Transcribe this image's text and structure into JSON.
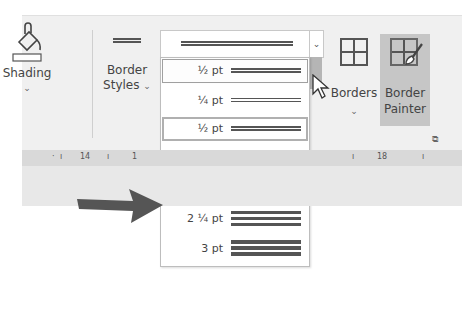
{
  "ribbon": {
    "shading": {
      "label": "Shading",
      "icon": "paint-bucket-icon"
    },
    "border_styles": {
      "label_line1": "Border",
      "label_line2": "Styles"
    },
    "pen_weight_dropdown": {
      "selected": "½ pt",
      "items": [
        {
          "label": "½ pt",
          "state": "selected-top"
        },
        {
          "label": "¼ pt"
        },
        {
          "label": "½ pt",
          "state": "highlighted"
        },
        {
          "label": "¾ pt"
        },
        {
          "label": "1 ½ pt",
          "state": "pointed"
        },
        {
          "label": "2 ¼ pt"
        },
        {
          "label": "3 pt"
        }
      ]
    },
    "borders": {
      "label": "Borders"
    },
    "border_painter": {
      "label_line1": "Border",
      "label_line2": "Painter"
    }
  },
  "ruler": {
    "marks": [
      "14",
      "1",
      "18"
    ]
  },
  "annotation": {
    "arrow_color": "#555555"
  }
}
